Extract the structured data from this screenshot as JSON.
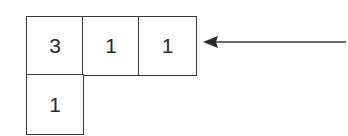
{
  "diagram": {
    "type": "young-diagram",
    "rows": [
      [
        "3",
        "1",
        "1"
      ],
      [
        "1"
      ]
    ],
    "arrow": {
      "direction": "left",
      "points_to": "row-1"
    },
    "colors": {
      "border": "#3a3a3a",
      "text": "#2a2a2a",
      "arrow": "#3a3a3a"
    }
  }
}
